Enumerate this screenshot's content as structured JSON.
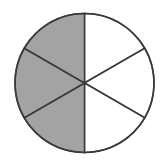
{
  "figure": {
    "type": "fraction-circle",
    "total_sectors": 6,
    "shaded_sectors": 3,
    "fraction_shaded": "3/6",
    "shaded_side": "left",
    "colors": {
      "shaded": "#a3a3a3",
      "unshaded": "#ffffff",
      "stroke": "#3a3a3a"
    }
  }
}
